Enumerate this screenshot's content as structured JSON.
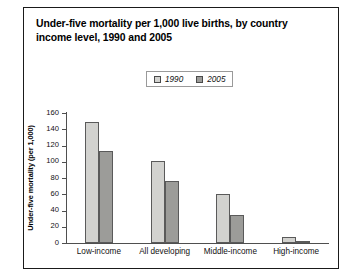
{
  "chart_data": {
    "type": "bar",
    "title": "Under-five mortality per 1,000 live births, by country income level, 1990 and 2005",
    "xlabel": "",
    "ylabel": "Under-five mortality (per 1,000)",
    "categories": [
      "Low-income",
      "All developing",
      "Middle-income",
      "High-income"
    ],
    "series": [
      {
        "name": "1990",
        "color": "#d2d2cf",
        "values": [
          149,
          101,
          60,
          7
        ]
      },
      {
        "name": "2005",
        "color": "#9c9c99",
        "values": [
          113,
          76,
          34,
          3
        ]
      }
    ],
    "ylim": [
      0,
      160
    ],
    "yticks": [
      0,
      20,
      40,
      60,
      80,
      100,
      120,
      140,
      160
    ],
    "ytick_labels": [
      "0",
      "20",
      "40",
      "60",
      "80",
      "100",
      "120",
      "140",
      "160"
    ],
    "grid": false,
    "legend_position": "top-center"
  }
}
